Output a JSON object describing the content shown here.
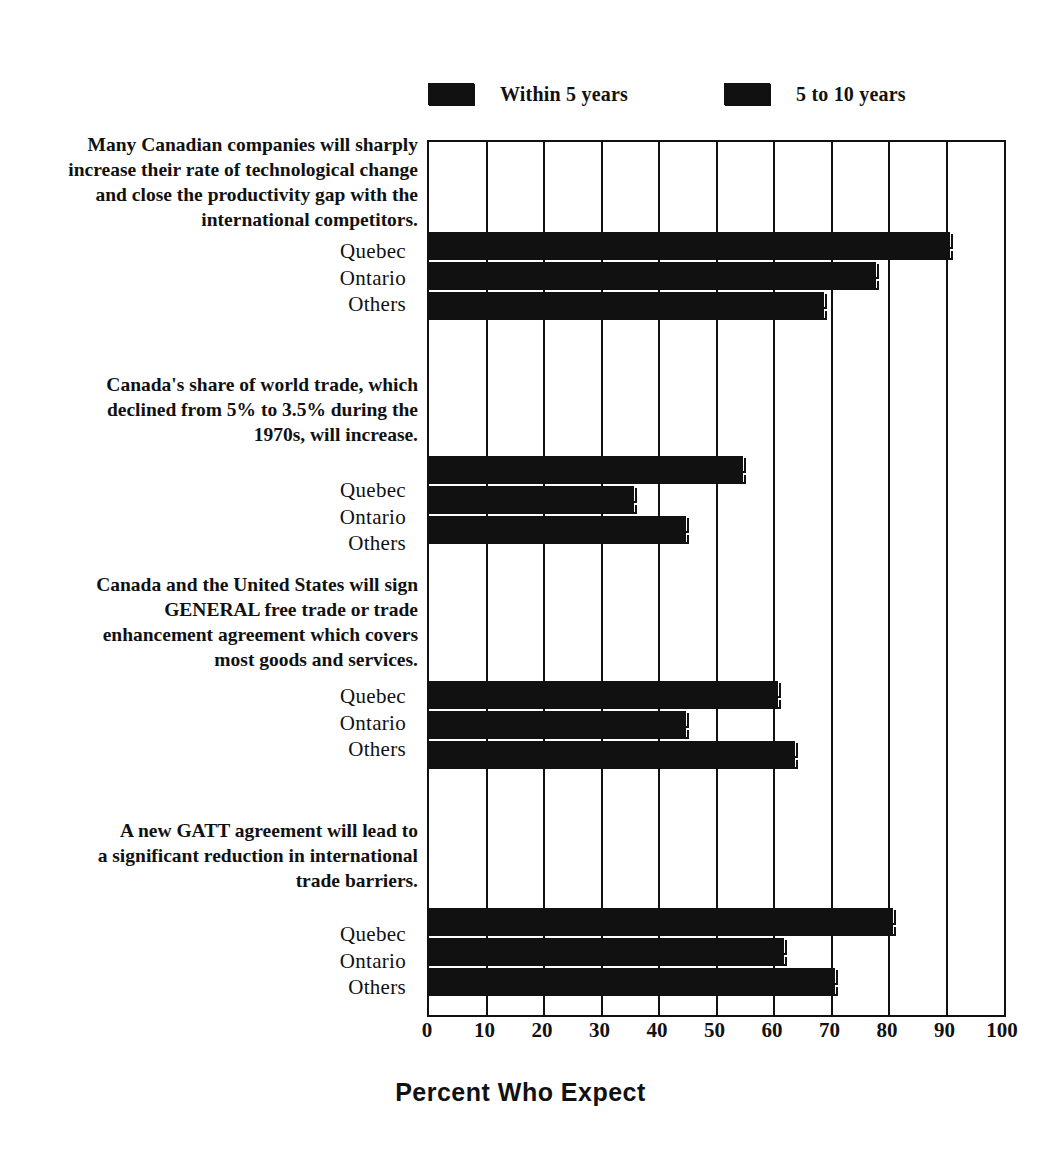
{
  "legend": {
    "entries": [
      {
        "label": "Within 5 years",
        "swatch": "legend-swatch-within-5-years",
        "color": "#111111"
      },
      {
        "label": "5 to 10 years",
        "swatch": "legend-swatch-5-to-10-years",
        "color": "#111111"
      }
    ]
  },
  "axis": {
    "xlabel": "Percent Who Expect",
    "ticks": [
      "0",
      "10",
      "20",
      "30",
      "40",
      "50",
      "60",
      "70",
      "80",
      "90",
      "100"
    ]
  },
  "questions": [
    {
      "lines": [
        "Many Canadian companies will sharply",
        "increase their rate of technological change",
        "and close the productivity gap with the",
        "international competitors."
      ],
      "rows": [
        "Quebec",
        "Ontario",
        "Others"
      ]
    },
    {
      "lines": [
        "Canada's share of world trade, which",
        "declined from 5% to 3.5% during the",
        "1970s, will increase."
      ],
      "rows": [
        "Quebec",
        "Ontario",
        "Others"
      ]
    },
    {
      "lines": [
        "Canada and the United States will sign",
        "GENERAL free trade or trade",
        "enhancement agreement which covers",
        "most goods and services."
      ],
      "rows": [
        "Quebec",
        "Ontario",
        "Others"
      ]
    },
    {
      "lines": [
        "A new GATT agreement will lead to",
        "a significant reduction in international",
        "trade barriers."
      ],
      "rows": [
        "Quebec",
        "Ontario",
        "Others"
      ]
    }
  ],
  "chart_data": {
    "type": "bar",
    "title": "",
    "xlabel": "Percent Who Expect",
    "ylabel": "",
    "xlim": [
      0,
      100
    ],
    "xticks": [
      0,
      10,
      20,
      30,
      40,
      50,
      60,
      70,
      80,
      90,
      100
    ],
    "grid": true,
    "orientation": "horizontal",
    "legend_position": "top",
    "series": [
      {
        "name": "Within 5 years"
      },
      {
        "name": "5 to 10 years"
      }
    ],
    "groups": [
      {
        "question": "Many Canadian companies will sharply increase their rate of technological change and close the productivity gap with the international competitors.",
        "categories": [
          "Quebec",
          "Ontario",
          "Others"
        ],
        "values": {
          "Within 5 years": [
            91,
            78,
            69
          ],
          "5 to 10 years": [
            91,
            78,
            69
          ]
        }
      },
      {
        "question": "Canada's share of world trade, which declined from 5% to 3.5% during the 1970s, will increase.",
        "categories": [
          "Quebec",
          "Ontario",
          "Others"
        ],
        "values": {
          "Within 5 years": [
            55,
            36,
            45
          ],
          "5 to 10 years": [
            55,
            36,
            45
          ]
        }
      },
      {
        "question": "Canada and the United States will sign GENERAL free trade or trade enhancement agreement which covers most goods and services.",
        "categories": [
          "Quebec",
          "Ontario",
          "Others"
        ],
        "values": {
          "Within 5 years": [
            61,
            45,
            64
          ],
          "5 to 10 years": [
            61,
            45,
            64
          ]
        }
      },
      {
        "question": "A new GATT agreement will lead to a significant reduction in international trade barriers.",
        "categories": [
          "Quebec",
          "Ontario",
          "Others"
        ],
        "values": {
          "Within 5 years": [
            81,
            62,
            71
          ],
          "5 to 10 years": [
            81,
            62,
            71
          ]
        }
      }
    ]
  }
}
